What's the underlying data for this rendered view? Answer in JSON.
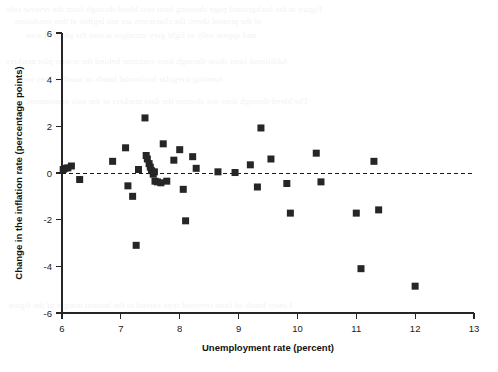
{
  "chart_data": {
    "type": "scatter",
    "title": "",
    "xlabel": "Unemployment rate (percent)",
    "ylabel": "Change in the inflation rate (percentage points)",
    "xlim": [
      6,
      13
    ],
    "ylim": [
      -6,
      6
    ],
    "xticks": [
      6,
      7,
      8,
      9,
      10,
      11,
      12,
      13
    ],
    "yticks": [
      6,
      4,
      2,
      0,
      -2,
      -4,
      -6
    ],
    "xtick_labels": [
      "6",
      "7",
      "8",
      "9",
      "10",
      "11",
      "12",
      "13"
    ],
    "ytick_labels": [
      "6",
      "4",
      "2",
      "0",
      "-2",
      "-4",
      "-6"
    ],
    "grid": false,
    "legend": "none",
    "marker": "square",
    "marker_color": "#262626",
    "reference_line": {
      "axis": "y",
      "value": 0,
      "style": "dashed"
    },
    "x": [
      6.02,
      6.05,
      6.1,
      6.16,
      6.3,
      6.86,
      7.08,
      7.12,
      7.2,
      7.26,
      7.3,
      7.41,
      7.43,
      7.45,
      7.48,
      7.5,
      7.52,
      7.55,
      7.57,
      7.58,
      7.62,
      7.68,
      7.72,
      7.78,
      7.9,
      8.0,
      8.06,
      8.1,
      8.22,
      8.28,
      8.65,
      8.94,
      9.2,
      9.32,
      9.38,
      9.55,
      9.82,
      9.88,
      10.32,
      10.4,
      11.0,
      11.08,
      11.3,
      11.38,
      12.0
    ],
    "y": [
      0.15,
      0.2,
      0.22,
      0.3,
      -0.28,
      0.5,
      1.08,
      -0.55,
      -1.0,
      -3.1,
      0.15,
      2.36,
      0.75,
      0.6,
      0.4,
      0.25,
      0.1,
      -0.05,
      0.05,
      -0.35,
      -0.38,
      -0.42,
      1.25,
      -0.35,
      0.55,
      1.0,
      -0.7,
      -2.05,
      0.7,
      0.2,
      0.05,
      0.02,
      0.35,
      -0.6,
      1.93,
      0.6,
      -0.45,
      -1.72,
      0.85,
      -0.38,
      -1.72,
      -4.1,
      0.5,
      -1.58,
      -4.85
    ]
  },
  "ghost_text": {
    "lines": [
      "Figure in the background page showing faint text bleed-through from the reverse side",
      "of the printed sheet; the characters are not legible at this resolution",
      "and appear only as light grey smudges across the plotting area.",
      "Additional faint show-through lines continue behind the scatter plot markers",
      "forming irregular horizontal bands of mottled grey tone.",
      "The bleed-through does not obscure the data markers or the axis annotations.",
      "Lower bands of faint reversed type extend to the bottom margin of the figure."
    ]
  }
}
